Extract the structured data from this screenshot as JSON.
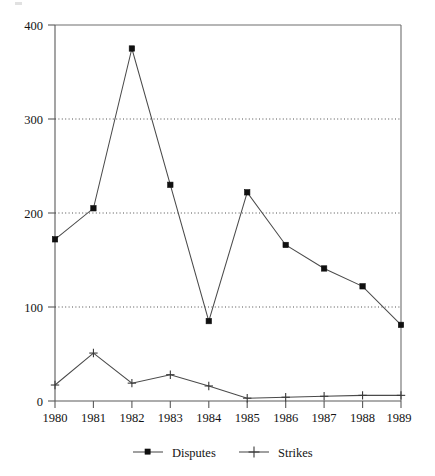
{
  "chart_data": {
    "type": "line",
    "title": "",
    "subtitle": "",
    "xlabel": "",
    "ylabel": "",
    "categories": [
      "1980",
      "1981",
      "1982",
      "1983",
      "1984",
      "1985",
      "1986",
      "1987",
      "1988",
      "1989"
    ],
    "series": [
      {
        "name": "Disputes",
        "marker": "square",
        "color": "#101010",
        "values": [
          172,
          205,
          375,
          230,
          85,
          222,
          166,
          141,
          122,
          81
        ]
      },
      {
        "name": "Strikes",
        "marker": "plus",
        "color": "#3a3a3a",
        "values": [
          17,
          51,
          19,
          28,
          16,
          3,
          4,
          5,
          6,
          6
        ]
      }
    ],
    "ylim": [
      0,
      400
    ],
    "yticks": [
      0,
      100,
      200,
      300,
      400
    ],
    "ytick_labels": [
      "0",
      "100",
      "200",
      "300",
      "400"
    ],
    "xtick_labels": [
      "1980",
      "1981",
      "1982",
      "1983",
      "1984",
      "1985",
      "1986",
      "1987",
      "1988",
      "1989"
    ],
    "grid": "horizontal-dotted",
    "legend_position": "bottom-center",
    "legend_entries": [
      {
        "label": "Disputes",
        "marker": "square"
      },
      {
        "label": "Strikes",
        "marker": "plus"
      }
    ]
  },
  "axes": {
    "y_axis_name": "y-axis",
    "x_axis_name": "x-axis"
  }
}
